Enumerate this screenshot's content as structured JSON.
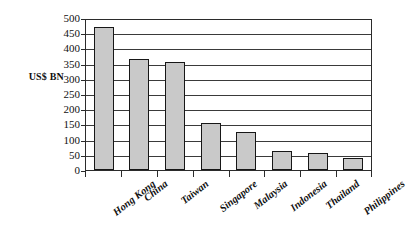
{
  "figure": {
    "top_smudge_text": "",
    "frame": {
      "visible": true,
      "grid": "horizontal"
    }
  },
  "chart_data": {
    "type": "bar",
    "title": "",
    "xlabel": "",
    "ylabel": "US$ BN",
    "categories": [
      "Hong Kong",
      "China",
      "Taiwan",
      "Singapore",
      "Malaysia",
      "Indonesia",
      "Thailand",
      "Philippines"
    ],
    "values": [
      470,
      365,
      355,
      155,
      125,
      62,
      57,
      38
    ],
    "ylim": [
      0,
      500
    ],
    "ytick_labels": [
      "500",
      "450",
      "400",
      "350",
      "300",
      "250",
      "200",
      "150",
      "100",
      "50",
      "0"
    ],
    "ytick_values": [
      500,
      450,
      400,
      350,
      300,
      250,
      200,
      150,
      100,
      50,
      0
    ],
    "grid": true,
    "legend": null,
    "bar_fill_color": "#c9c9c9",
    "bar_edge_color": "#171717",
    "axis_color": "#2b2b2b",
    "background_color": "#ffffff"
  }
}
